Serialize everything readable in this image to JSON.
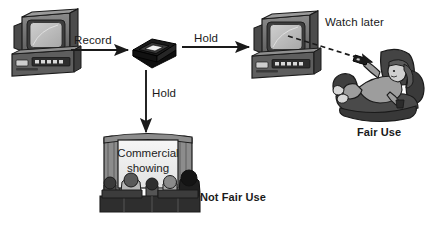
{
  "diagram": {
    "background_color": "#ffffff",
    "ink_color": "#1a1a1a",
    "arrows": {
      "record_label": "Record",
      "hold_horizontal_label": "Hold",
      "hold_vertical_label": "Hold",
      "watch_later_label": "Watch later"
    },
    "verdicts": {
      "fair_use_label": "Fair Use",
      "not_fair_use_label": "Not Fair Use"
    },
    "cinema": {
      "screen_line_1": "Commercial",
      "screen_line_2": "showing"
    },
    "nodes": {
      "source_tv_vcr": "TV and VCR recording unit",
      "vhs_tape": "VHS cassette tape",
      "playback_tv_vcr": "TV and VCR playback unit",
      "home_viewer": "Person reclining in armchair with remote",
      "movie_theater": "Movie theater screen with audience"
    },
    "colors": {
      "ink": "#1a1a1a",
      "tape_body": "#141414",
      "tape_label": "#f2f2f2",
      "tv_casing": "#6e6e6e",
      "tv_casing_dark": "#3e3e3e",
      "tv_screen": "#b8b8b8",
      "vcr_body": "#555555",
      "cinema_curtain": "#8c8c8c",
      "cinema_screen": "#ededed",
      "audience": "#2a2a2a",
      "chair": "#4a4a4a",
      "skin": "#cfcfcf"
    }
  }
}
